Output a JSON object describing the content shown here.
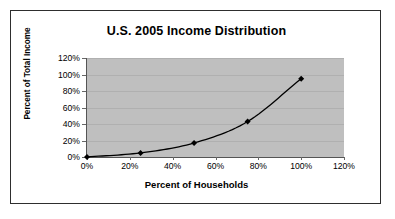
{
  "chart_data": {
    "type": "line",
    "title": "U.S. 2005 Income Distribution",
    "xlabel": "Percent of Households",
    "ylabel": "Percent of Total Income",
    "x": [
      0,
      25,
      50,
      75,
      100
    ],
    "values": [
      0,
      5,
      17,
      43,
      95
    ],
    "x_tick_labels": [
      "0%",
      "20%",
      "40%",
      "60%",
      "80%",
      "100%",
      "120%"
    ],
    "x_ticks": [
      0,
      20,
      40,
      60,
      80,
      100,
      120
    ],
    "y_tick_labels": [
      "0%",
      "20%",
      "40%",
      "60%",
      "80%",
      "100%",
      "120%"
    ],
    "y_ticks": [
      0,
      20,
      40,
      60,
      80,
      100,
      120
    ],
    "xlim": [
      0,
      120
    ],
    "ylim": [
      0,
      120
    ],
    "grid": true,
    "legend": "none",
    "marker": "diamond",
    "series_color": "#000000",
    "plot_background_color": "#bfbfbf",
    "frame_border_color": "#2e2e2e",
    "page_background_color": "#ffffff"
  }
}
